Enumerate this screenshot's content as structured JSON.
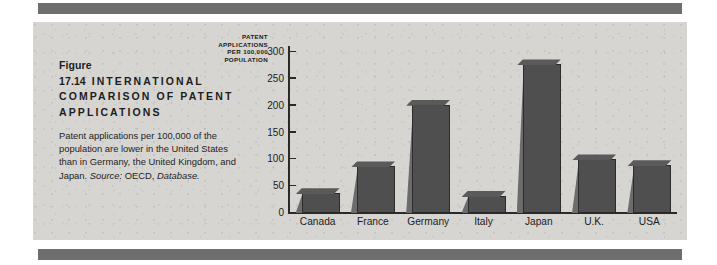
{
  "figure": {
    "number": "Figure 17.14",
    "title": "INTERNATIONAL COMPARISON OF PATENT APPLICATIONS",
    "description_part1": "Patent applications per 100,000 of the population are lower in the United States than in Germany, the United Kingdom, and Japan. ",
    "source_label": "Source:",
    "source_text": " OECD, ",
    "source_database": "Database."
  },
  "colors": {
    "panel_background": "#d6d5d2",
    "rule": "#6e6e6e",
    "bar_face": "#4f4f4f",
    "bar_side": "#6c6c6c",
    "axis": "#2a2a2a",
    "text": "#1d1d1d"
  },
  "chart_data": {
    "type": "bar",
    "title": "International Comparison of Patent Applications",
    "xlabel": "",
    "ylabel": "PATENT APPLICATIONS PER 100,000 POPULATION",
    "ylabel_lines": [
      "PATENT",
      "APPLICATIONS",
      "PER 100,000",
      "POPULATION"
    ],
    "categories": [
      "Canada",
      "France",
      "Germany",
      "Italy",
      "Japan",
      "U.K.",
      "USA"
    ],
    "values": [
      35,
      85,
      200,
      30,
      275,
      98,
      87
    ],
    "ylim": [
      0,
      300
    ],
    "yticks": [
      0,
      50,
      100,
      150,
      200,
      250,
      300
    ],
    "ytick_labels": [
      "0",
      "50",
      "100",
      "150",
      "200",
      "250",
      "300"
    ],
    "grid": false,
    "legend": false
  }
}
